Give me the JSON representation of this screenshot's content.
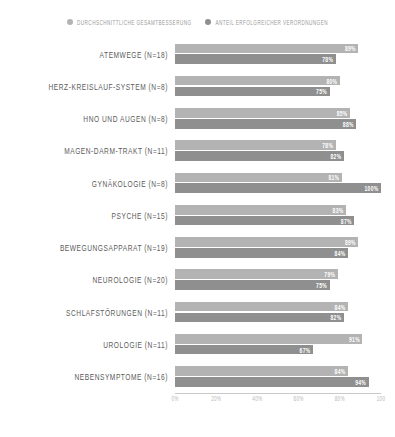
{
  "legend": {
    "items": [
      {
        "label": "DURCHSCHNITTLICHE GESAMTBESSERUNG",
        "color": "#b3b3b3",
        "icon": "circle-icon"
      },
      {
        "label": "ANTEIL ERFOLGREICHER VERORDNUNGEN",
        "color": "#8f8f8f",
        "icon": "circle-icon"
      }
    ]
  },
  "axis": {
    "ticks": [
      "0%",
      "20%",
      "40%",
      "60%",
      "80%",
      "100"
    ]
  },
  "chart_data": {
    "type": "bar",
    "orientation": "horizontal",
    "title": "",
    "xlabel": "",
    "ylabel": "",
    "xlim": [
      0,
      100
    ],
    "grid": false,
    "legend_position": "top-center",
    "categories": [
      "ATEMWEGE (N=18)",
      "HERZ-KREISLAUF-SYSTEM (N=8)",
      "HNO UND AUGEN (N=8)",
      "MAGEN-DARM-TRAKT (N=11)",
      "GYNÄKOLOGIE (N=8)",
      "PSYCHE (N=15)",
      "BEWEGUNGSAPPARAT (N=19)",
      "NEUROLOGIE (N=20)",
      "SCHLAFSTÖRUNGEN (N=11)",
      "UROLOGIE (N=11)",
      "NEBENSYMPTOME (N=16)"
    ],
    "series": [
      {
        "name": "DURCHSCHNITTLICHE GESAMTBESSERUNG",
        "color": "#b3b3b3",
        "values": [
          89,
          80,
          85,
          78,
          81,
          83,
          89,
          79,
          84,
          91,
          84
        ],
        "labels": [
          "89%",
          "80%",
          "85%",
          "78%",
          "81%",
          "83%",
          "89%",
          "79%",
          "84%",
          "91%",
          "84%"
        ]
      },
      {
        "name": "ANTEIL ERFOLGREICHER VERORDNUNGEN",
        "color": "#8f8f8f",
        "values": [
          78,
          75,
          88,
          82,
          100,
          87,
          84,
          75,
          82,
          67,
          94
        ],
        "labels": [
          "78%",
          "75%",
          "88%",
          "82%",
          "100%",
          "87%",
          "84%",
          "75%",
          "82%",
          "67%",
          "94%"
        ]
      }
    ]
  }
}
